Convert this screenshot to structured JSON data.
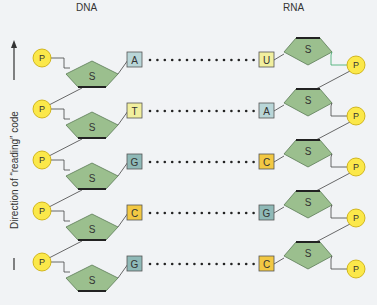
{
  "titles": {
    "dna": "DNA",
    "rna": "RNA"
  },
  "axis_label": "Direction of “reading” code",
  "sugar_label": "S",
  "phosphate_label": "P",
  "pairs": [
    {
      "dna": "A",
      "rna": "U"
    },
    {
      "dna": "T",
      "rna": "A"
    },
    {
      "dna": "G",
      "rna": "C"
    },
    {
      "dna": "C",
      "rna": "G"
    },
    {
      "dna": "G",
      "rna": "C"
    }
  ],
  "colors": {
    "A": "#b9d6d8",
    "T": "#f1ef9e",
    "G": "#8fb9b7",
    "C": "#f2c843",
    "U": "#f1ef9e",
    "sugar": "#9bbf8e",
    "phosphate": "#fbe84a",
    "background": "#f1f3f5"
  }
}
